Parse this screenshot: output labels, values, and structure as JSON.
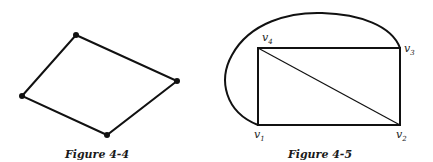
{
  "figures": [
    {
      "id": "fig-4-4",
      "caption": "Figure 4-4",
      "type": "quadrilateral graph",
      "vertices": [
        {
          "name": "top",
          "x": 76,
          "y": 35
        },
        {
          "name": "right",
          "x": 177,
          "y": 81
        },
        {
          "name": "bottom",
          "x": 107,
          "y": 135
        },
        {
          "name": "left",
          "x": 22,
          "y": 96
        }
      ],
      "edges": [
        [
          "top",
          "right"
        ],
        [
          "right",
          "bottom"
        ],
        [
          "bottom",
          "left"
        ],
        [
          "left",
          "top"
        ]
      ]
    },
    {
      "id": "fig-4-5",
      "caption": "Figure 4-5",
      "type": "planar graph",
      "vertices": [
        {
          "name": "v1",
          "label": "v",
          "sub": "1",
          "x": 258,
          "y": 125
        },
        {
          "name": "v2",
          "label": "v",
          "sub": "2",
          "x": 400,
          "y": 125
        },
        {
          "name": "v3",
          "label": "v",
          "sub": "3",
          "x": 400,
          "y": 48
        },
        {
          "name": "v4",
          "label": "v",
          "sub": "4",
          "x": 258,
          "y": 48
        }
      ],
      "edges": [
        [
          "v1",
          "v2"
        ],
        [
          "v2",
          "v3"
        ],
        [
          "v3",
          "v4"
        ],
        [
          "v4",
          "v1"
        ],
        [
          "v4",
          "v2"
        ],
        [
          "v1",
          "v3 (curved, outer)"
        ]
      ]
    }
  ]
}
